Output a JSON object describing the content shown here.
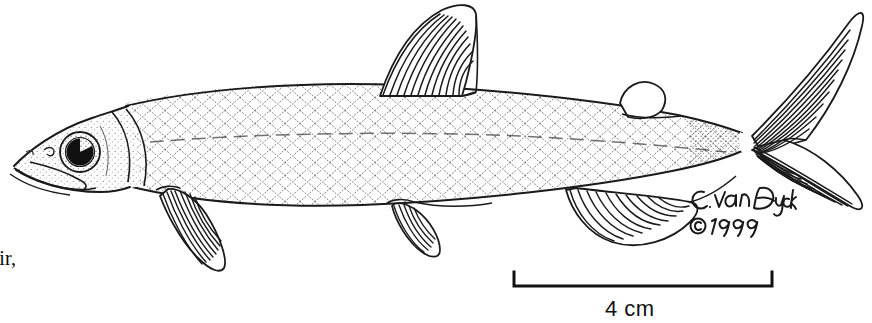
{
  "plate": {
    "width": 872,
    "height": 323,
    "background_color": "#ffffff",
    "ink_color": "#111111",
    "subject": "lateral-view-fish-line-drawing",
    "common_description": "whitefish-cisco-lateral-illustration"
  },
  "caption": {
    "fragment_text": "oir,",
    "note": "clipped caption text at left page edge"
  },
  "scale_bar": {
    "label": "4 cm",
    "left_tick_x": 514,
    "right_tick_x": 772,
    "bar_y": 285,
    "tick_height": 14,
    "stroke_width": 3
  },
  "artist_credit": {
    "signature": "C. van Dyck",
    "copyright_symbol": "©",
    "year": "1999"
  },
  "anatomy": {
    "parts": [
      {
        "name": "head",
        "label": "Head"
      },
      {
        "name": "eye",
        "label": "Eye"
      },
      {
        "name": "pupil",
        "label": "Pupil"
      },
      {
        "name": "mouth",
        "label": "Mouth"
      },
      {
        "name": "operculum",
        "label": "Operculum"
      },
      {
        "name": "body",
        "label": "Body"
      },
      {
        "name": "lateral-line",
        "label": "Lateral line"
      },
      {
        "name": "dorsal-fin",
        "label": "Dorsal fin"
      },
      {
        "name": "adipose-fin",
        "label": "Adipose fin"
      },
      {
        "name": "pectoral-fin",
        "label": "Pectoral fin"
      },
      {
        "name": "pelvic-fin",
        "label": "Pelvic fin"
      },
      {
        "name": "anal-fin",
        "label": "Anal fin"
      },
      {
        "name": "caudal-peduncle",
        "label": "Caudal peduncle"
      },
      {
        "name": "caudal-fin",
        "label": "Caudal fin"
      }
    ]
  }
}
